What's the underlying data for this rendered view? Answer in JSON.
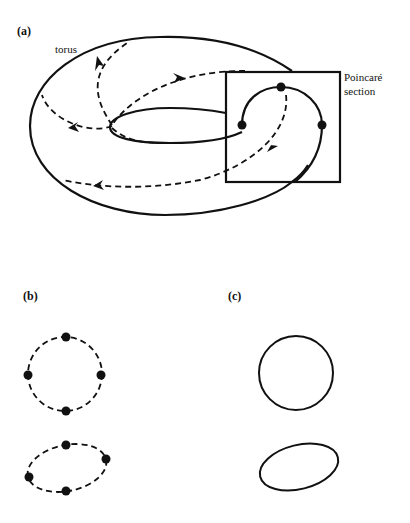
{
  "panels": {
    "a": {
      "label": "(a)",
      "torus_label": "torus",
      "section_label_line1": "Poincaré",
      "section_label_line2": "section"
    },
    "b": {
      "label": "(b)"
    },
    "c": {
      "label": "(c)"
    }
  },
  "colors": {
    "ink": "#111111",
    "background": "#ffffff"
  }
}
